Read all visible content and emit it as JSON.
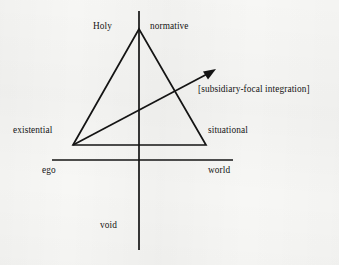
{
  "figure": {
    "kind": "axis-triangle-diagram",
    "background_color": "#f7f7f5",
    "ink_color": "#141414",
    "axes": {
      "vertical": {
        "name": "vertical-axis",
        "x": 139,
        "y_top": 11,
        "y_bottom": 250,
        "top_label": "Holy",
        "bottom_label": "void"
      },
      "horizontal": {
        "name": "horizontal-axis",
        "y": 160,
        "x_left": 52,
        "x_right": 233,
        "left_label": "ego",
        "right_label": "world"
      }
    },
    "triangle": {
      "name": "central-triangle",
      "apex": {
        "x": 139,
        "y": 29,
        "label": "Holy / normative"
      },
      "bottom_left": {
        "x": 73,
        "y": 145,
        "label": "existential"
      },
      "bottom_right": {
        "x": 206,
        "y": 145,
        "label": "situational"
      }
    },
    "arrow": {
      "name": "integration-arrow",
      "from": {
        "x": 73,
        "y": 145
      },
      "to": {
        "x": 215,
        "y": 70
      },
      "label": "[subsidiary-focal integration]"
    },
    "labels": {
      "holy": "Holy",
      "normative": "normative",
      "existential": "existential",
      "situational": "situational",
      "ego": "ego",
      "world": "world",
      "void": "void",
      "annotation": "[subsidiary-focal integration]"
    }
  }
}
